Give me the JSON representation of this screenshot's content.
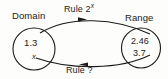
{
  "figure": {
    "title_domain": "Domain",
    "title_range": "Range",
    "rule_top": "Rule 2",
    "rule_top_exponent": "x",
    "rule_bottom": "Rule ?",
    "domain_value": "1.3",
    "domain_variable": "x",
    "range_value_1": "2.46",
    "range_value_2": "3.7",
    "colors": {
      "ink": "#1a1a1a",
      "background": "#fdfdfc"
    },
    "icons": {
      "arrow_forward": "arrow-right",
      "arrow_backward": "arrow-left"
    }
  }
}
